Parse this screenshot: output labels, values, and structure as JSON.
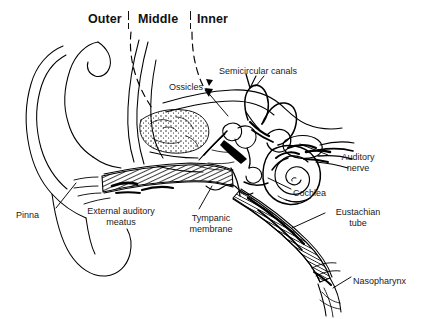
{
  "figure": {
    "type": "anatomical-line-diagram",
    "background_color": "#ffffff",
    "ink_color": "#000000"
  },
  "section_labels": [
    {
      "id": "outer",
      "text": "Outer",
      "x": 88,
      "y": 12
    },
    {
      "id": "middle",
      "text": "Middle",
      "x": 138,
      "y": 12
    },
    {
      "id": "inner",
      "text": "Inner",
      "x": 197,
      "y": 12
    }
  ],
  "dividers": [
    {
      "id": "outer-middle-divider",
      "x": 128,
      "y": 10
    },
    {
      "id": "middle-inner-divider",
      "x": 190,
      "y": 10
    }
  ],
  "part_labels": [
    {
      "id": "ossicles",
      "text": "Ossicles",
      "x": 169,
      "y": 82,
      "align": "left"
    },
    {
      "id": "semicircular-canals",
      "text": "Semicircular canals",
      "x": 219,
      "y": 66,
      "align": "left"
    },
    {
      "id": "auditory-nerve",
      "text": "Auditory\nnerve",
      "x": 330,
      "y": 152,
      "align": "left"
    },
    {
      "id": "cochlea",
      "text": "Cochlea",
      "x": 293,
      "y": 188,
      "align": "left"
    },
    {
      "id": "eustachian-tube",
      "text": "Eustachian\ntube",
      "x": 327,
      "y": 207,
      "align": "left"
    },
    {
      "id": "nasopharynx",
      "text": "Nasopharynx",
      "x": 353,
      "y": 276,
      "align": "left"
    },
    {
      "id": "tympanic-membrane",
      "text": "Tympanic\nmembrane",
      "x": 182,
      "y": 213,
      "align": "left"
    },
    {
      "id": "external-auditory-meatus",
      "text": "External auditory\nmeatus",
      "x": 79,
      "y": 206,
      "align": "left"
    },
    {
      "id": "pinna",
      "text": "Pinna",
      "x": 16,
      "y": 210,
      "align": "left"
    }
  ]
}
